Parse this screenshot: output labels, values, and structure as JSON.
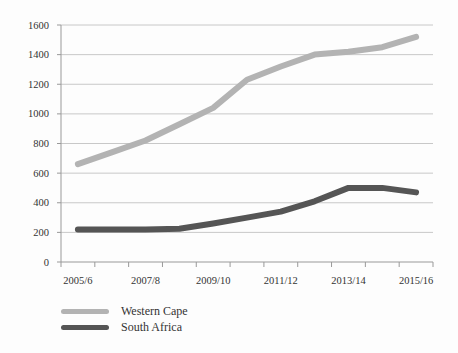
{
  "chart_data": {
    "type": "line",
    "title": "",
    "xlabel": "",
    "ylabel": "",
    "categories": [
      "2005/6",
      "2006/7",
      "2007/8",
      "2008/9",
      "2009/10",
      "2010/11",
      "2011/12",
      "2012/13",
      "2013/14",
      "2014/15",
      "2015/16"
    ],
    "x_tick_labels": [
      "2005/6",
      "2007/8",
      "2009/10",
      "2011/12",
      "2013/14",
      "2015/16"
    ],
    "y_ticks": [
      0,
      200,
      400,
      600,
      800,
      1000,
      1200,
      1400,
      1600
    ],
    "ylim": [
      0,
      1600
    ],
    "grid": "horizontal",
    "legend_position": "bottom-left",
    "series": [
      {
        "name": "Western Cape",
        "color": "#b3b3b3",
        "values": [
          660,
          740,
          820,
          930,
          1040,
          1230,
          1320,
          1400,
          1420,
          1450,
          1520
        ]
      },
      {
        "name": "South Africa",
        "color": "#555555",
        "values": [
          220,
          220,
          220,
          225,
          260,
          300,
          340,
          410,
          500,
          500,
          470
        ]
      }
    ]
  },
  "legend": {
    "items": [
      {
        "label": "Western Cape",
        "color": "#b3b3b3"
      },
      {
        "label": "South Africa",
        "color": "#555555"
      }
    ]
  }
}
